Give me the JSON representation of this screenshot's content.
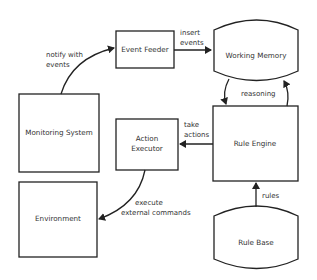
{
  "diagram": {
    "type": "flowchart",
    "nodes": {
      "event_feeder": {
        "label": "Event Feeder",
        "shape": "rectangle"
      },
      "working_memory": {
        "label": "Working Memory",
        "shape": "cylinder"
      },
      "monitoring_system": {
        "label": "Monitoring System",
        "shape": "rectangle"
      },
      "action_executor": {
        "line1": "Action",
        "line2": "Executor",
        "shape": "rectangle"
      },
      "rule_engine": {
        "label": "Rule Engine",
        "shape": "rectangle"
      },
      "environment": {
        "label": "Environment",
        "shape": "rectangle"
      },
      "rule_base": {
        "label": "Rule Base",
        "shape": "cylinder"
      }
    },
    "edges": {
      "notify": {
        "from": "Monitoring System",
        "to": "Event Feeder",
        "line1": "notify with",
        "line2": "events"
      },
      "insert": {
        "from": "Event Feeder",
        "to": "Working Memory",
        "line1": "insert",
        "line2": "events"
      },
      "reasoning": {
        "between": [
          "Working Memory",
          "Rule Engine"
        ],
        "label": "reasoning"
      },
      "take_actions": {
        "from": "Rule Engine",
        "to": "Action Executor",
        "line1": "take",
        "line2": "actions"
      },
      "execute": {
        "from": "Action Executor",
        "to": "Environment",
        "line1": "execute",
        "line2": "external commands"
      },
      "rules": {
        "from": "Rule Base",
        "to": "Rule Engine",
        "label": "rules"
      }
    }
  }
}
